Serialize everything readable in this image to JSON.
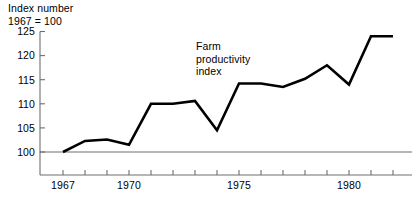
{
  "axis_title": {
    "line1": "Index number",
    "line2": "1967 = 100"
  },
  "annotation": {
    "line1": "Farm",
    "line2": "productivity",
    "line3": "index"
  },
  "colors": {
    "line": "#000000",
    "axis": "#6f6f6f",
    "background": "#ffffff"
  },
  "chart_data": {
    "type": "line",
    "title": "",
    "subtitle": "",
    "xlabel": "",
    "ylabel": "Index number 1967 = 100",
    "annotations": [
      "Farm productivity index"
    ],
    "grid": false,
    "legend": "none",
    "xlim": [
      1967,
      1982
    ],
    "ylim": [
      100,
      125
    ],
    "yticks": [
      100,
      105,
      110,
      115,
      120,
      125
    ],
    "ytick_labels": [
      "100",
      "105",
      "110",
      "115",
      "120",
      "125"
    ],
    "xticks": [
      1967,
      1968,
      1969,
      1970,
      1971,
      1972,
      1973,
      1974,
      1975,
      1976,
      1977,
      1978,
      1979,
      1980,
      1981,
      1982
    ],
    "xtick_labels_shown": [
      "1967",
      "1970",
      "1975",
      "1980"
    ],
    "x": [
      1967,
      1968,
      1969,
      1970,
      1971,
      1972,
      1973,
      1974,
      1975,
      1976,
      1977,
      1978,
      1979,
      1980,
      1981,
      1982
    ],
    "values": [
      100.0,
      102.3,
      102.6,
      101.5,
      110.0,
      110.0,
      110.6,
      104.5,
      114.2,
      114.2,
      113.5,
      115.2,
      118.0,
      114.0,
      124.0,
      124.0
    ],
    "series": [
      {
        "name": "Farm productivity index",
        "values": [
          100.0,
          102.3,
          102.6,
          101.5,
          110.0,
          110.0,
          110.6,
          104.5,
          114.2,
          114.2,
          113.5,
          115.2,
          118.0,
          114.0,
          124.0,
          124.0
        ]
      }
    ]
  }
}
